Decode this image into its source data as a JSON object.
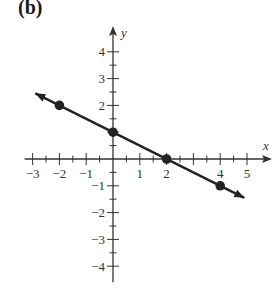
{
  "panel_label": "(b)",
  "chart_data": {
    "type": "line",
    "title": "",
    "xlabel": "x",
    "ylabel": "y",
    "xlim": [
      -3,
      5
    ],
    "ylim": [
      -4,
      4
    ],
    "x_ticks_labeled": [
      -3,
      -2,
      -1,
      1,
      2,
      4,
      5
    ],
    "x_tick_labels": [
      "−3",
      "−2",
      "−1",
      "1",
      "2",
      "4",
      "5"
    ],
    "y_ticks_labeled": [
      4,
      3,
      2,
      -1,
      -2,
      -3,
      -4
    ],
    "y_tick_labels": [
      "4",
      "3",
      "2",
      "−1",
      "−2",
      "−3",
      "−4"
    ],
    "minor_tick_step": 0.5,
    "grid": false,
    "series": [
      {
        "name": "line",
        "equation": "y = -0.5x + 1",
        "slope": -0.5,
        "intercept": 1,
        "x_range": [
          -2.9,
          4.9
        ],
        "arrows": "both",
        "color": "#222222"
      }
    ],
    "points": [
      {
        "x": -2,
        "y": 2
      },
      {
        "x": 0,
        "y": 1
      },
      {
        "x": 2,
        "y": 0
      },
      {
        "x": 4,
        "y": -1
      }
    ]
  },
  "colors": {
    "line": "#222222",
    "axis": "#333333",
    "background": "#ffffff"
  }
}
